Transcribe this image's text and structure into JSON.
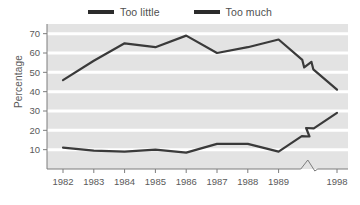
{
  "legend": {
    "items": [
      {
        "label": "Too little",
        "color": "#2b2b2b",
        "name": "legend-too-little"
      },
      {
        "label": "Too much",
        "color": "#2b2b2b",
        "name": "legend-too-much"
      }
    ]
  },
  "axes": {
    "ylabel": "Percentage",
    "yticks": [
      "10",
      "20",
      "30",
      "40",
      "50",
      "60",
      "70"
    ],
    "xticks": [
      "1982",
      "1983",
      "1984",
      "1985",
      "1986",
      "1987",
      "1988",
      "1989",
      "1998"
    ]
  },
  "style": {
    "plot_background": "#e3e3e3",
    "gridline_color": "#ffffff",
    "line_color": "#3a3a3a",
    "axis_color": "#7d7d7d",
    "text_color": "#5a5a5a"
  },
  "chart_data": {
    "type": "line",
    "title": "",
    "xlabel": "",
    "ylabel": "Percentage",
    "categories": [
      "1982",
      "1983",
      "1984",
      "1985",
      "1986",
      "1987",
      "1988",
      "1989",
      "1998"
    ],
    "axis_break": {
      "present": true,
      "between": [
        "1989",
        "1998"
      ],
      "note": "zigzag break on x-axis and on both series"
    },
    "ylim": [
      0,
      75
    ],
    "yticks": [
      10,
      20,
      30,
      40,
      50,
      60,
      70
    ],
    "grid": "horizontal",
    "legend_position": "top",
    "series": [
      {
        "name": "Too little",
        "values": [
          46,
          56,
          65,
          63,
          69,
          60,
          63,
          67,
          41
        ]
      },
      {
        "name": "Too much",
        "values": [
          11,
          9.5,
          9,
          10,
          8.5,
          13,
          13,
          9,
          29
        ]
      }
    ]
  }
}
